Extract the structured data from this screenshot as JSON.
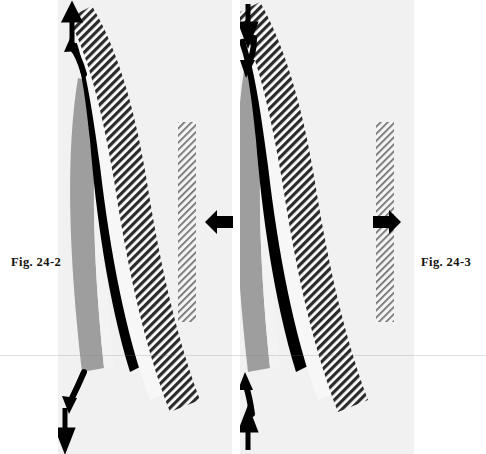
{
  "figure": {
    "type": "diagram",
    "background_color": "#ffffff",
    "panel_background_color": "#f1f1f1"
  },
  "captions": {
    "left": "Fig. 24-2",
    "right": "Fig. 24-3"
  },
  "panels": [
    {
      "id": "left",
      "caption": "Fig. 24-2",
      "x": 58,
      "width": 174,
      "layers": [
        {
          "name": "gray-band",
          "color": "#9b9b9b",
          "order": 1
        },
        {
          "name": "black-band",
          "color": "#000000",
          "order": 2
        },
        {
          "name": "white-gap",
          "color": "#f5f5f5",
          "order": 3
        },
        {
          "name": "hatched-band",
          "color": "#3a3a3a",
          "order": 4,
          "fill": "diagonal-hatch-dark"
        },
        {
          "name": "vertical-hatched-bar",
          "color": "#8a8a8a",
          "order": 5,
          "fill": "diagonal-hatch-light"
        }
      ],
      "arrows": [
        {
          "name": "top-straight-up",
          "direction": "up",
          "style": "straight",
          "x": 72,
          "y": 10
        },
        {
          "name": "top-curved-up",
          "direction": "up",
          "style": "curved",
          "x": 72,
          "y": 42
        },
        {
          "name": "bottom-curved-down",
          "direction": "down",
          "style": "curved",
          "x": 70,
          "y": 382
        },
        {
          "name": "bottom-straight-down",
          "direction": "down",
          "style": "straight",
          "x": 63,
          "y": 412
        },
        {
          "name": "mid-horizontal",
          "direction": "left",
          "style": "straight",
          "x": 204,
          "y": 209
        }
      ]
    },
    {
      "id": "right",
      "caption": "Fig. 24-3",
      "x": 240,
      "width": 174,
      "layers": [
        {
          "name": "gray-band",
          "color": "#9b9b9b",
          "order": 1
        },
        {
          "name": "black-band",
          "color": "#000000",
          "order": 2
        },
        {
          "name": "white-gap",
          "color": "#f5f5f5",
          "order": 3
        },
        {
          "name": "hatched-band",
          "color": "#3a3a3a",
          "order": 4,
          "fill": "diagonal-hatch-dark"
        },
        {
          "name": "vertical-hatched-bar",
          "color": "#8a8a8a",
          "order": 5,
          "fill": "diagonal-hatch-light"
        }
      ],
      "arrows": [
        {
          "name": "top-straight-down",
          "direction": "down",
          "style": "straight",
          "x": 246,
          "y": 4
        },
        {
          "name": "top-curved-down",
          "direction": "down",
          "style": "curved",
          "x": 246,
          "y": 34
        },
        {
          "name": "bottom-curved-up",
          "direction": "up",
          "style": "curved",
          "x": 243,
          "y": 380
        },
        {
          "name": "bottom-straight-up",
          "direction": "up",
          "style": "straight",
          "x": 243,
          "y": 412
        },
        {
          "name": "mid-horizontal",
          "direction": "right",
          "style": "straight",
          "x": 372,
          "y": 209
        }
      ]
    }
  ],
  "icons": {
    "arrow_up": "arrow-up-icon",
    "arrow_down": "arrow-down-icon",
    "arrow_left": "arrow-left-icon",
    "arrow_right": "arrow-right-icon",
    "arrow_curved_up": "arrow-curved-up-icon",
    "arrow_curved_down": "arrow-curved-down-icon"
  }
}
